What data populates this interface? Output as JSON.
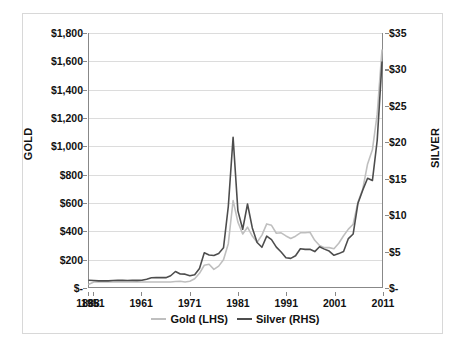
{
  "chart_data": {
    "type": "line",
    "title": "",
    "xlabel": "",
    "ylabel": "GOLD",
    "y2label": "SILVER",
    "grid": true,
    "legend_position": "bottom",
    "ylim": [
      0,
      1800
    ],
    "y2lim": [
      0,
      35
    ],
    "y_tick_labels": [
      "$1,800",
      "$1,600",
      "$1,400",
      "$1,200",
      "$1,000",
      "$800",
      "$600",
      "$400",
      "$200",
      "$-"
    ],
    "y_tick_values": [
      1800,
      1600,
      1400,
      1200,
      1000,
      800,
      600,
      400,
      200,
      0
    ],
    "y2_tick_labels": [
      "$35",
      "$30",
      "$25",
      "$20",
      "$15",
      "$10",
      "$5",
      "$-"
    ],
    "y2_tick_values": [
      35,
      30,
      25,
      20,
      15,
      10,
      5,
      0
    ],
    "x_tick_labels": [
      "1888",
      "1951",
      "1961",
      "1971",
      "1981",
      "1991",
      "2001",
      "2011"
    ],
    "x_tick_values": [
      1888,
      1951,
      1961,
      1971,
      1981,
      1991,
      2001,
      2011
    ],
    "x_axis_note": "Category axis: 1888 then yearly from 1951 to 2011; tick labels every 10 years",
    "series": [
      {
        "name": "Gold (LHS)",
        "axis": "left",
        "color": "#bfbfbf",
        "unit": "USD per ounce",
        "x": [
          1888,
          1951,
          1952,
          1953,
          1954,
          1955,
          1956,
          1957,
          1958,
          1959,
          1960,
          1961,
          1962,
          1963,
          1964,
          1965,
          1966,
          1967,
          1968,
          1969,
          1970,
          1971,
          1972,
          1973,
          1974,
          1975,
          1976,
          1977,
          1978,
          1979,
          1980,
          1981,
          1982,
          1983,
          1984,
          1985,
          1986,
          1987,
          1988,
          1989,
          1990,
          1991,
          1992,
          1993,
          1994,
          1995,
          1996,
          1997,
          1998,
          1999,
          2000,
          2001,
          2002,
          2003,
          2004,
          2005,
          2006,
          2007,
          2008,
          2009,
          2010,
          2011
        ],
        "values": [
          19,
          35,
          35,
          35,
          35,
          35,
          35,
          35,
          35,
          35,
          36,
          35,
          35,
          35,
          35,
          35,
          35,
          35,
          39,
          41,
          36,
          41,
          58,
          97,
          154,
          161,
          125,
          148,
          193,
          307,
          613,
          460,
          376,
          424,
          361,
          317,
          368,
          447,
          437,
          381,
          384,
          362,
          344,
          360,
          384,
          384,
          388,
          331,
          294,
          279,
          279,
          271,
          310,
          363,
          410,
          445,
          603,
          695,
          872,
          972,
          1225,
          1680
        ],
        "notes": "Peak $613 in 1980; rises to about $1,680-1,700 in 2011"
      },
      {
        "name": "Silver (RHS)",
        "axis": "right",
        "color": "#4d4d4d",
        "unit": "USD per ounce",
        "x": [
          1888,
          1951,
          1952,
          1953,
          1954,
          1955,
          1956,
          1957,
          1958,
          1959,
          1960,
          1961,
          1962,
          1963,
          1964,
          1965,
          1966,
          1967,
          1968,
          1969,
          1970,
          1971,
          1972,
          1973,
          1974,
          1975,
          1976,
          1977,
          1978,
          1979,
          1980,
          1981,
          1982,
          1983,
          1984,
          1985,
          1986,
          1987,
          1988,
          1989,
          1990,
          1991,
          1992,
          1993,
          1994,
          1995,
          1996,
          1997,
          1998,
          1999,
          2000,
          2001,
          2002,
          2003,
          2004,
          2005,
          2006,
          2007,
          2008,
          2009,
          2010,
          2011
        ],
        "values": [
          0.94,
          0.89,
          0.85,
          0.85,
          0.85,
          0.89,
          0.91,
          0.91,
          0.89,
          0.91,
          0.91,
          0.92,
          1.08,
          1.28,
          1.29,
          1.29,
          1.29,
          1.55,
          2.14,
          1.79,
          1.77,
          1.55,
          1.68,
          2.56,
          4.71,
          4.42,
          4.35,
          4.62,
          5.4,
          11.09,
          20.63,
          10.49,
          7.95,
          11.44,
          8.14,
          6.14,
          5.47,
          7.01,
          6.53,
          5.5,
          4.82,
          4.04,
          3.94,
          4.3,
          5.28,
          5.19,
          5.19,
          4.88,
          5.54,
          5.22,
          4.95,
          4.37,
          4.6,
          4.88,
          6.67,
          7.31,
          11.55,
          13.38,
          14.99,
          14.67,
          20.19,
          31.0
        ],
        "notes": "Peak $20.63 in 1980; rises to about $31 in 2011"
      }
    ]
  },
  "axes": {
    "left_title": "GOLD",
    "right_title": "SILVER"
  },
  "legend": {
    "items": [
      {
        "label": "Gold (LHS)",
        "color": "#bfbfbf"
      },
      {
        "label": "Silver (RHS)",
        "color": "#4d4d4d"
      }
    ]
  },
  "colors": {
    "gold_line": "#bfbfbf",
    "silver_line": "#4d4d4d",
    "gridline": "#dcdcdc",
    "axis": "#888888",
    "frame": "#d8d8d8",
    "text": "#111111",
    "background": "#ffffff"
  }
}
